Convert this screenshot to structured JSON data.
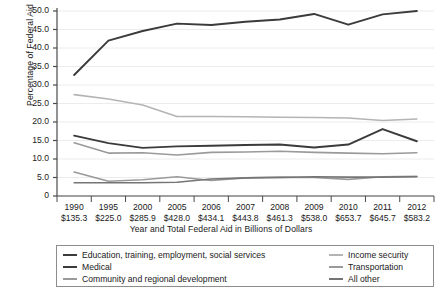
{
  "chart_data": {
    "type": "line",
    "title": "",
    "xlabel": "Year and Total Federal Aid in Billions of Dollars",
    "ylabel": "Percentage of Federal Aid",
    "categories": [
      "1990",
      "1995",
      "2000",
      "2005",
      "2006",
      "2007",
      "2008",
      "2009",
      "2010",
      "2011",
      "2012"
    ],
    "x_sublabels": [
      "$135.3",
      "$225.0",
      "$285.9",
      "$428.0",
      "$434.1",
      "$443.8",
      "$461.3",
      "$538.0",
      "$653.7",
      "$645.7",
      "$583.2"
    ],
    "ylim": [
      0,
      50
    ],
    "yticks": [
      "0",
      "5.0",
      "10.0",
      "15.0",
      "20.0",
      "25.0",
      "30.0",
      "35.0",
      "40.0",
      "45.0",
      "50.0"
    ],
    "grid": true,
    "legend_position": "bottom",
    "series": [
      {
        "name": "Education, training, employment, social services",
        "color": "#3b3b3b",
        "values": [
          32.7,
          42.0,
          44.6,
          46.6,
          46.2,
          47.1,
          47.7,
          49.2,
          46.3,
          49.1,
          50.0
        ]
      },
      {
        "name": "Medical",
        "color": "#3b3b3b",
        "values": [
          16.3,
          14.3,
          13.0,
          13.4,
          13.6,
          13.8,
          13.9,
          13.1,
          13.9,
          18.1,
          14.8
        ]
      },
      {
        "name": "Community and regional development",
        "color": "#9a9a9a",
        "values": [
          6.5,
          4.0,
          4.4,
          5.2,
          4.2,
          4.9,
          5.1,
          5.0,
          4.5,
          5.2,
          5.3
        ]
      },
      {
        "name": "Income security",
        "color": "#b4b4b4",
        "values": [
          27.4,
          26.2,
          24.6,
          21.5,
          21.5,
          21.4,
          21.3,
          21.2,
          21.1,
          20.4,
          20.8
        ]
      },
      {
        "name": "Transportation",
        "color": "#9a9a9a",
        "values": [
          14.4,
          11.6,
          11.7,
          11.1,
          11.8,
          11.9,
          12.1,
          11.8,
          11.6,
          11.4,
          11.7
        ]
      },
      {
        "name": "All other",
        "color": "#757575",
        "values": [
          3.6,
          3.6,
          3.6,
          3.7,
          4.6,
          4.9,
          5.0,
          5.2,
          5.1,
          5.1,
          5.2
        ]
      }
    ]
  },
  "legend": {
    "left_items": [
      {
        "label": "Education, training, employment, social services",
        "color": "#3b3b3b"
      },
      {
        "label": "Medical",
        "color": "#3b3b3b"
      },
      {
        "label": "Community and regional development",
        "color": "#9a9a9a"
      }
    ],
    "right_items": [
      {
        "label": "Income security",
        "color": "#b4b4b4"
      },
      {
        "label": "Transportation",
        "color": "#9a9a9a"
      },
      {
        "label": "All other",
        "color": "#757575"
      }
    ]
  },
  "style": {
    "axis_color": "#4a4a4a",
    "grid_color": "#ececec",
    "background": "#ffffff"
  }
}
